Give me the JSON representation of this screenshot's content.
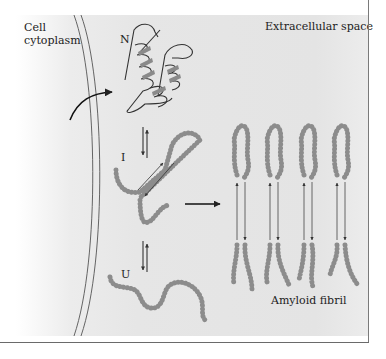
{
  "figure": {
    "labels": {
      "cell_cytoplasm": "Cell cytoplasm",
      "extracellular_space": "Extracellular space",
      "native_state": "N",
      "intermediate_state": "I",
      "unfolded_state": "U",
      "amyloid_fibril": "Amyloid fibril"
    },
    "colors": {
      "panel_background": "#e6e6e6",
      "bead_fill": "#9a9a9a",
      "bead_stroke": "#6e6e6e",
      "line": "#333333",
      "text": "#222222"
    },
    "fibril_strand_count": 4
  }
}
